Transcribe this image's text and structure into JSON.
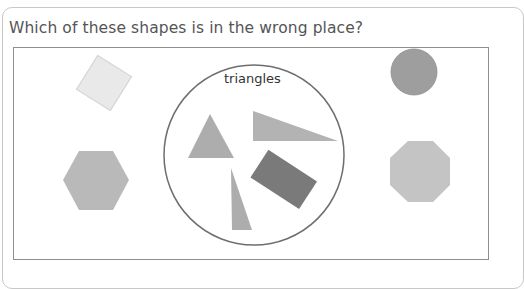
{
  "question": {
    "text": "Which of these shapes is in the wrong place?"
  },
  "sorting_circle": {
    "label": "triangles"
  },
  "colors": {
    "frame_border": "#8e8e8e",
    "circle_border": "#6e6e6e",
    "square_fill": "#e9e9e9",
    "hexagon_fill": "#b9b9b9",
    "circle_fill": "#9e9e9e",
    "octagon_fill": "#c4c4c4",
    "triangle_fill": "#adadad",
    "rectangle_fill": "#7a7a7a"
  },
  "shapes": [
    {
      "name": "square",
      "location": "outside"
    },
    {
      "name": "hexagon",
      "location": "outside"
    },
    {
      "name": "circle",
      "location": "outside"
    },
    {
      "name": "octagon",
      "location": "outside"
    },
    {
      "name": "equilateral-triangle",
      "location": "inside"
    },
    {
      "name": "right-triangle-wide",
      "location": "inside"
    },
    {
      "name": "right-triangle-tall",
      "location": "inside"
    },
    {
      "name": "rectangle",
      "location": "inside"
    }
  ]
}
